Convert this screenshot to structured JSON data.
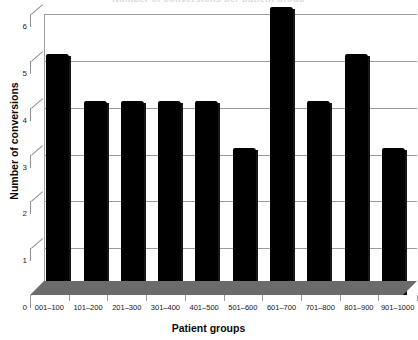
{
  "chart_data": {
    "type": "bar",
    "title": "Number of conversions per patient group",
    "xlabel": "Patient groups",
    "ylabel": "Number of conversions",
    "categories": [
      "001–100",
      "101–200",
      "201–300",
      "301–400",
      "401–500",
      "501–600",
      "601–700",
      "701–800",
      "801–900",
      "901–1000"
    ],
    "values": [
      5,
      4,
      4,
      4,
      4,
      3,
      6,
      4,
      5,
      3
    ],
    "ylim": [
      0,
      6
    ],
    "yticks": [
      "0",
      "1",
      "2",
      "3",
      "4",
      "5",
      "6"
    ],
    "ytick_values": [
      0,
      1,
      2,
      3,
      4,
      5,
      6
    ],
    "grid": true,
    "legend": "none",
    "bar_color": "#000000",
    "grid_color": "#9a9a9f",
    "floor_color": "#6b6b6b",
    "style": "3d-perspective"
  }
}
